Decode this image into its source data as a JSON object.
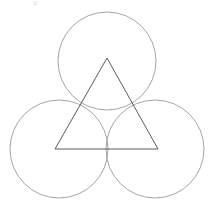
{
  "figure": {
    "canvas": {
      "width": 212,
      "height": 208,
      "background": "#ffffff"
    },
    "colors": {
      "circle_stroke": "#9a9a9a",
      "triangle_stroke": "#5a5a5a",
      "artifact_stroke": "#e2e2e2",
      "background": "#ffffff"
    },
    "stroke_widths": {
      "circle": 0.9,
      "triangle": 1.0,
      "artifact": 0.7
    },
    "circles": [
      {
        "name": "top-circle",
        "label": "Top circle",
        "cx": 107,
        "cy": 61,
        "r": 49
      },
      {
        "name": "bottom-left-circle",
        "label": "Bottom left circle",
        "cx": 59,
        "cy": 149,
        "r": 49
      },
      {
        "name": "bottom-right-circle",
        "label": "Bottom right circle",
        "cx": 155,
        "cy": 149,
        "r": 49
      }
    ],
    "triangle": {
      "name": "inscribed-triangle",
      "label": "Equilateral triangle",
      "points": "107,58 158,149 55,149",
      "vertices": [
        {
          "label": "apex",
          "x": 107,
          "y": 58
        },
        {
          "label": "bottom-right",
          "x": 158,
          "y": 149
        },
        {
          "label": "bottom-left",
          "x": 55,
          "y": 149
        }
      ]
    },
    "artifact": {
      "name": "faint-mark",
      "label": "Faint scan artifact",
      "path": "M33,2 L38,2 M33,4 L37,4 M35,1 L35,6"
    }
  }
}
